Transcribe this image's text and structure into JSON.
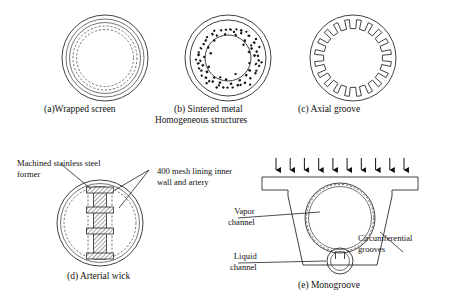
{
  "figure": {
    "group_caption": "Homogeneous structures",
    "panels": [
      {
        "id": "a",
        "caption": "(a)Wrapped screen",
        "type": "concentric-screen-layers"
      },
      {
        "id": "b",
        "caption": "(b) Sintered metal",
        "type": "annulus-sintered-powder"
      },
      {
        "id": "c",
        "caption": "(c) Axial groove",
        "type": "internally-toothed-ring",
        "teeth": 20
      },
      {
        "id": "d",
        "caption": "(d) Arterial wick",
        "type": "arterial-wick-section"
      },
      {
        "id": "e",
        "caption": "(e) Monogroove",
        "type": "monogroove-section"
      }
    ],
    "labels": {
      "machined_former": "Machined stainless steel\nformer",
      "machined_former_line1": "Machined stainless steel",
      "machined_former_line2": "former",
      "mesh_lining_line1": "400 mesh lining inner",
      "mesh_lining_line2": "wall and artery",
      "vapor_channel_line1": "Vapor",
      "vapor_channel_line2": "channel",
      "liquid_channel_line1": "Liquid",
      "liquid_channel_line2": "channel",
      "circumferential_line1": "Circumferential",
      "circumferential_line2": "grooves"
    },
    "colors": {
      "stroke": "#2b2b2b",
      "thin_stroke": "#3a3a3a",
      "speckle": "#111111",
      "background": "#ffffff"
    },
    "heat_arrows": {
      "count": 10,
      "direction": "down"
    }
  }
}
